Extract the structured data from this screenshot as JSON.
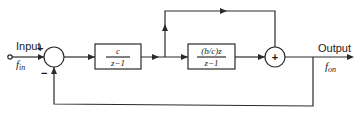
{
  "diagram": {
    "type": "block-diagram",
    "input": {
      "label": "Input",
      "signal": "f_in",
      "signal_display": "fin"
    },
    "output": {
      "label": "Output",
      "signal": "f_on",
      "signal_display": "fon"
    },
    "summing_junction_1": {
      "signs": {
        "input": "+",
        "feedback": "−"
      }
    },
    "block_1": {
      "numerator": "c",
      "denominator": "z−1"
    },
    "block_2": {
      "numerator": "(b/c)z",
      "denominator": "z−1"
    },
    "summing_junction_2": {
      "symbol": "+"
    },
    "connections": [
      "input -> summing_junction_1 (+)",
      "summing_junction_1 -> block_1",
      "block_1 -> block_2",
      "block_1 output -> summing_junction_2 (feed-forward bypass)",
      "block_2 -> summing_junction_2",
      "summing_junction_2 -> output",
      "output -> summing_junction_1 (−) feedback"
    ]
  }
}
